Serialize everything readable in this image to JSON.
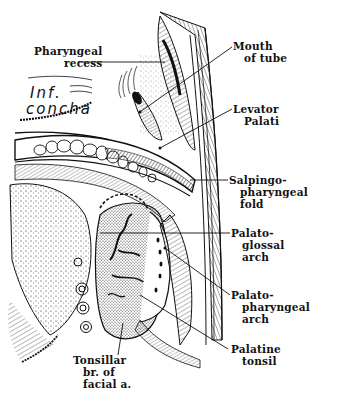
{
  "figure": {
    "colors": {
      "ink": "#111111",
      "background": "#ffffff"
    }
  },
  "labels": {
    "pharyngeal_recess": [
      "Pharyngeal",
      "recess"
    ],
    "inf_concha": [
      "Inf.",
      "concha"
    ],
    "mouth_of_tube": [
      "Mouth",
      "of tube"
    ],
    "levator_palati": [
      "Levator",
      "Palati"
    ],
    "salpingopharyngeal_fold": [
      "Salpingo-",
      "pharyngeal",
      "fold"
    ],
    "palatoglossal_arch": [
      "Palato-",
      "glossal",
      "arch"
    ],
    "palatopharyngeal_arch": [
      "Palato-",
      "pharyngeal",
      "arch"
    ],
    "palatine_tonsil": [
      "Palatine",
      "tonsil"
    ],
    "tonsillar_branch": [
      "Tonsillar",
      "br. of",
      "facial a."
    ]
  }
}
